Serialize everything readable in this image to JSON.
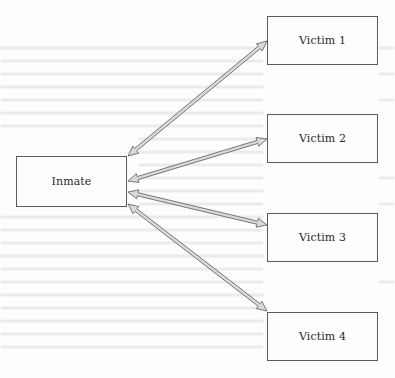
{
  "diagram": {
    "type": "hub-and-spoke relationship diagram",
    "colors": {
      "node_border": "#5a5a5a",
      "node_fill": "#fdfdfc",
      "arrow_fill": "#d9d9d9",
      "arrow_stroke": "#6a6a6a",
      "text": "#2a2a2a",
      "background": "#fdfdfc"
    },
    "hub": {
      "id": "inmate",
      "label": "Inmate",
      "box": {
        "x": 16,
        "y": 156,
        "w": 111,
        "h": 51
      }
    },
    "spokes": [
      {
        "id": "victim-1",
        "label": "Victim 1",
        "box": {
          "x": 267,
          "y": 16,
          "w": 111,
          "h": 49
        }
      },
      {
        "id": "victim-2",
        "label": "Victim 2",
        "box": {
          "x": 267,
          "y": 114,
          "w": 111,
          "h": 49
        }
      },
      {
        "id": "victim-3",
        "label": "Victim 3",
        "box": {
          "x": 267,
          "y": 213,
          "w": 111,
          "h": 49
        }
      },
      {
        "id": "victim-4",
        "label": "Victim 4",
        "box": {
          "x": 267,
          "y": 312,
          "w": 111,
          "h": 49
        }
      }
    ],
    "edges": [
      {
        "from": "inmate",
        "to": "victim-1",
        "direction": "bidirectional",
        "x1": 128,
        "y1": 156,
        "x2": 267,
        "y2": 41
      },
      {
        "from": "inmate",
        "to": "victim-2",
        "direction": "bidirectional",
        "x1": 128,
        "y1": 181,
        "x2": 267,
        "y2": 139
      },
      {
        "from": "inmate",
        "to": "victim-3",
        "direction": "bidirectional",
        "x1": 128,
        "y1": 192,
        "x2": 267,
        "y2": 225
      },
      {
        "from": "inmate",
        "to": "victim-4",
        "direction": "bidirectional",
        "x1": 128,
        "y1": 204,
        "x2": 267,
        "y2": 311
      }
    ]
  }
}
